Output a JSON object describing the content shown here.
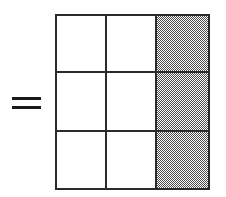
{
  "figure": {
    "background_color": "#ffffff",
    "width": 226,
    "height": 197,
    "equals_sign": {
      "symbol": "=",
      "color": "#1a1a1a",
      "bar_count": 2
    },
    "grid": {
      "rows": 3,
      "columns": 3,
      "total_cells": 9,
      "shaded_cells": 3,
      "unshaded_cells": 6,
      "fraction_shaded": "3/9",
      "shaded_column_index": 2,
      "line_color": "#2b2b2b",
      "cell_fill_unshaded": "#ffffff",
      "cell_fill_shaded": "#4a4a4a",
      "cells": [
        [
          {
            "label": "r1c1",
            "shaded": false
          },
          {
            "label": "r1c2",
            "shaded": false
          },
          {
            "label": "r1c3",
            "shaded": true
          }
        ],
        [
          {
            "label": "r2c1",
            "shaded": false
          },
          {
            "label": "r2c2",
            "shaded": false
          },
          {
            "label": "r2c3",
            "shaded": true
          }
        ],
        [
          {
            "label": "r3c1",
            "shaded": false
          },
          {
            "label": "r3c2",
            "shaded": false
          },
          {
            "label": "r3c3",
            "shaded": true
          }
        ]
      ]
    }
  }
}
